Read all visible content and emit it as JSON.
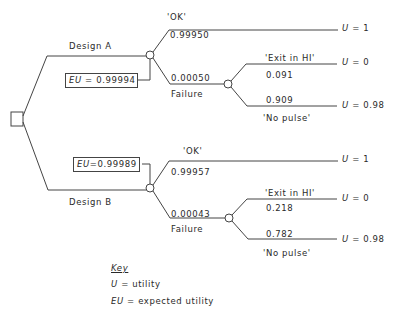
{
  "diagram": {
    "type": "decision-tree",
    "design_a": {
      "label": "Design A",
      "eu_label": "EU",
      "eu_value": "= 0.99994",
      "ok": {
        "label": "'OK'",
        "prob": "0.99950",
        "utility": "= 1"
      },
      "failure": {
        "label": "Failure",
        "prob": "0.00050",
        "exit": {
          "label": "'Exit in HI'",
          "prob": "0.091",
          "utility": "= 0"
        },
        "no_pulse": {
          "label": "'No pulse'",
          "prob": "0.909",
          "utility": "= 0.98"
        }
      }
    },
    "design_b": {
      "label": "Design B",
      "eu_label": "EU",
      "eu_value": "=0.99989",
      "ok": {
        "label": "'OK'",
        "prob": "0.99957",
        "utility": "= 1"
      },
      "failure": {
        "label": "Failure",
        "prob": "0.00043",
        "exit": {
          "label": "'Exit in HI'",
          "prob": "0.218",
          "utility": "= 0"
        },
        "no_pulse": {
          "label": "'No pulse'",
          "prob": "0.782",
          "utility": "= 0.98"
        }
      }
    },
    "utility_symbol": "U",
    "key": {
      "title": "Key",
      "items": [
        {
          "symbol": "U",
          "text": "= utility"
        },
        {
          "symbol": "EU",
          "text": "= expected utility"
        }
      ]
    }
  }
}
